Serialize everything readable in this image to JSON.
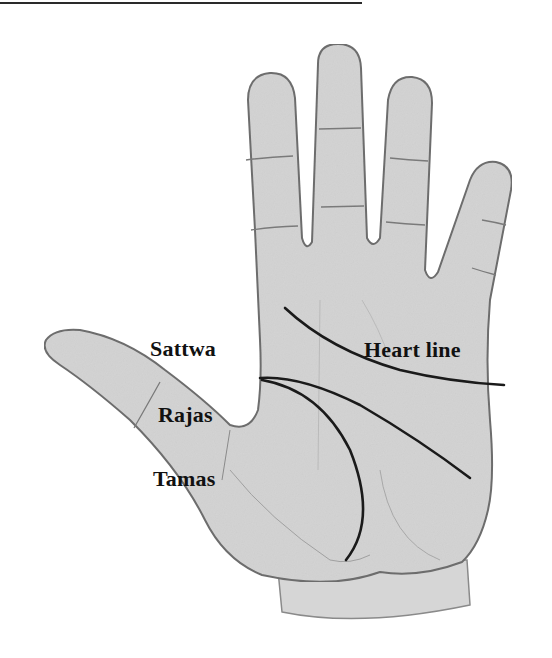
{
  "figure": {
    "labels": {
      "sattwa": "Sattwa",
      "rajas": "Rajas",
      "tamas": "Tamas",
      "heart_line": "Heart line"
    },
    "colors": {
      "skin_fill": "#d4d4d4",
      "outline": "#6e6e6e",
      "crease": "#7a7a7a",
      "palm_line": "#1a1a1a",
      "text": "#111111",
      "rule": "#2a2a2a"
    }
  }
}
